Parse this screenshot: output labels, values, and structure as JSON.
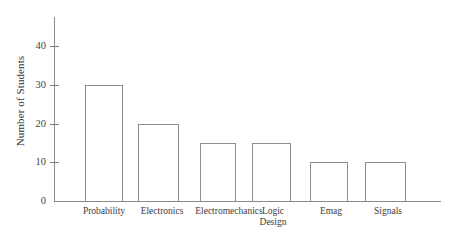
{
  "chart_data": {
    "type": "bar",
    "title": "",
    "xlabel": "",
    "ylabel": "Number of Students",
    "categories": [
      "Probability",
      "Electronics",
      "Electromechanics",
      "Logic\nDesign",
      "Emag",
      "Signals"
    ],
    "values": [
      30,
      20,
      15,
      15,
      10,
      10
    ],
    "ylim": [
      0,
      45
    ],
    "yticks": [
      0,
      10,
      20,
      30,
      40
    ],
    "ytick_labels": [
      "0",
      "10",
      "20",
      "30",
      "40"
    ],
    "grid": false,
    "legend": "none",
    "bar_style": {
      "fill": "none",
      "edge_color": "#8e8e8e",
      "axis_color": "#8a8a8a",
      "background": "#ffffff",
      "text_color": "#3a3a3a"
    }
  }
}
